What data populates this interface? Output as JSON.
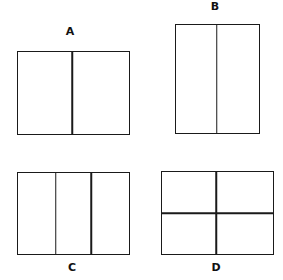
{
  "figure": {
    "line_color": "#1a1a1a",
    "background": "#ffffff",
    "panels": [
      {
        "id": "A",
        "label": "A",
        "shape": "rectangle",
        "orientation": "landscape",
        "vertical_divisions": 2,
        "horizontal_divisions": 1
      },
      {
        "id": "B",
        "label": "B",
        "shape": "rectangle",
        "orientation": "portrait",
        "vertical_divisions": 2,
        "horizontal_divisions": 1
      },
      {
        "id": "C",
        "label": "C",
        "shape": "rectangle",
        "orientation": "landscape",
        "vertical_divisions": 3,
        "horizontal_divisions": 1
      },
      {
        "id": "D",
        "label": "D",
        "shape": "rectangle",
        "orientation": "landscape",
        "vertical_divisions": 2,
        "horizontal_divisions": 2
      }
    ]
  }
}
